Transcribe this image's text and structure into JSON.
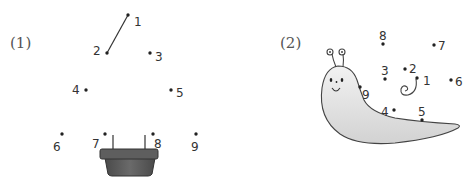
{
  "puzzles": [
    {
      "label": "(1)",
      "subject": "potted plant",
      "colors": {
        "pot_dark": "#555555",
        "pot_mid": "#6b6b6b",
        "line": "#333333"
      },
      "dots": [
        {
          "n": "1"
        },
        {
          "n": "2"
        },
        {
          "n": "3"
        },
        {
          "n": "4"
        },
        {
          "n": "5"
        },
        {
          "n": "6"
        },
        {
          "n": "7"
        },
        {
          "n": "8"
        },
        {
          "n": "9"
        }
      ],
      "connected": [
        [
          "1",
          "2"
        ]
      ]
    },
    {
      "label": "(2)",
      "subject": "slug / snail",
      "colors": {
        "body_fill": "#e6e6e6",
        "outline": "#444444"
      },
      "dots": [
        {
          "n": "1"
        },
        {
          "n": "2"
        },
        {
          "n": "3"
        },
        {
          "n": "4"
        },
        {
          "n": "5"
        },
        {
          "n": "6"
        },
        {
          "n": "7"
        },
        {
          "n": "8"
        },
        {
          "n": "9"
        }
      ],
      "connected": []
    }
  ]
}
